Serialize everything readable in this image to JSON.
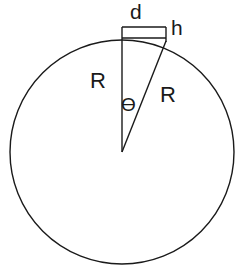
{
  "diagram": {
    "background_color": "#ffffff",
    "stroke_color": "#1a1a1a",
    "labels": {
      "d": "d",
      "h": "h",
      "radius_left": "R",
      "radius_right": "R",
      "theta": "ϴ"
    },
    "geometry": {
      "circle": {
        "center_x": 122,
        "center_y": 152,
        "radius": 112
      },
      "apex": {
        "x": 122,
        "y": 152
      },
      "top_point": {
        "x": 122,
        "y": 40
      },
      "arc_point": {
        "x": 166,
        "y": 41
      },
      "rectangle": {
        "left": 122,
        "top": 27,
        "right": 166,
        "bottom": 38
      }
    }
  }
}
